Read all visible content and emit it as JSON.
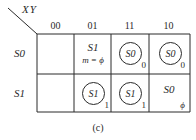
{
  "corner_label": "XY",
  "columns": [
    "00",
    "01",
    "11",
    "10"
  ],
  "rows": [
    {
      "label": "S0",
      "cells": [
        {
          "state": "",
          "circled": false,
          "output": "",
          "note": ""
        },
        {
          "state": "S1",
          "circled": false,
          "output": "",
          "note": "m = ϕ"
        },
        {
          "state": "S0",
          "circled": true,
          "output": "0",
          "note": ""
        },
        {
          "state": "S0",
          "circled": true,
          "output": "0",
          "note": ""
        }
      ]
    },
    {
      "label": "S1",
      "cells": [
        {
          "state": "",
          "circled": false,
          "output": "",
          "note": ""
        },
        {
          "state": "S1",
          "circled": true,
          "output": "1",
          "note": ""
        },
        {
          "state": "S1",
          "circled": true,
          "output": "1",
          "note": ""
        },
        {
          "state": "S0",
          "circled": false,
          "output": "ϕ",
          "note": ""
        }
      ]
    }
  ],
  "caption": "(c)",
  "colors": {
    "line": "#2a2a2a",
    "background": "#ffffff"
  }
}
